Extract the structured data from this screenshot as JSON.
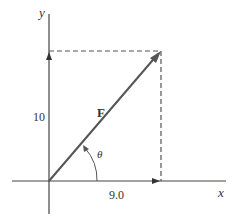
{
  "diagram": {
    "type": "vector-components",
    "axes": {
      "x_label": "x",
      "y_label": "y"
    },
    "vector": {
      "label": "F",
      "angle_label": "θ"
    },
    "components": {
      "x_value": "9.0",
      "y_value": "10"
    },
    "colors": {
      "axis": "#444444",
      "vector": "#555555",
      "dashed": "#555555",
      "text": "#333333"
    }
  }
}
